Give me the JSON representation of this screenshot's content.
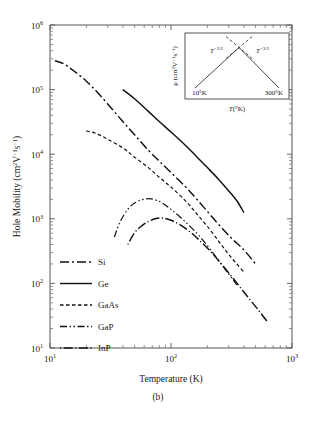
{
  "figure": {
    "caption": "(b)",
    "background": "#ffffff",
    "line_color": "#111111"
  },
  "axes": {
    "x": {
      "label": "Temperature (K)",
      "ticks": [
        {
          "value": 10,
          "mantissa": "10",
          "exponent": "1"
        },
        {
          "value": 100,
          "mantissa": "10",
          "exponent": "2"
        },
        {
          "value": 1000,
          "mantissa": "10",
          "exponent": "3"
        }
      ],
      "min": 10,
      "max": 1000,
      "scale": "log"
    },
    "y": {
      "label_prefix": "Hole Mobility (cm",
      "label_full": "Hole Mobility (cm²V⁻¹s⁻¹)",
      "ticks": [
        {
          "value": 10,
          "mantissa": "10",
          "exponent": "1"
        },
        {
          "value": 100,
          "mantissa": "10",
          "exponent": "2"
        },
        {
          "value": 1000,
          "mantissa": "10",
          "exponent": "3"
        },
        {
          "value": 10000,
          "mantissa": "10",
          "exponent": "4"
        },
        {
          "value": 100000,
          "mantissa": "10",
          "exponent": "5"
        },
        {
          "value": 1000000,
          "mantissa": "10",
          "exponent": "6"
        }
      ],
      "min": 10,
      "max": 1000000,
      "scale": "log"
    }
  },
  "legend": {
    "items": [
      {
        "label": "Si",
        "dash": "9 3 2 3"
      },
      {
        "label": "Ge",
        "dash": "none"
      },
      {
        "label": "GaAs",
        "dash": "3.5 2.5"
      },
      {
        "label": "GaP",
        "dash": "7 2.5 1.5 2.5 1.5 2.5"
      },
      {
        "label": "InP",
        "dash": "1.2 2.5 9 2.5"
      }
    ]
  },
  "inset": {
    "y_label": "μ (cm² V⁻¹ s⁻¹)",
    "x_label": "T(°K)",
    "left_branch_label": "T",
    "left_branch_exponent": "−3/2",
    "right_branch_label": "T",
    "right_branch_exponent": "−3/2",
    "left_tick_label": "10°K",
    "right_tick_label": "300°K"
  },
  "chart_data": {
    "type": "line",
    "title": "",
    "xlabel": "Temperature (K)",
    "ylabel": "Hole Mobility (cm2 V-1 s-1)",
    "xscale": "log",
    "yscale": "log",
    "xlim": [
      10,
      1000
    ],
    "ylim": [
      10,
      1000000
    ],
    "grid": false,
    "legend_position": "lower-left",
    "series": [
      {
        "name": "Si",
        "dash": "9 3 2 3",
        "points": [
          [
            11,
            280000
          ],
          [
            13,
            250000
          ],
          [
            16,
            190000
          ],
          [
            20,
            135000
          ],
          [
            25,
            88000
          ],
          [
            32,
            52000
          ],
          [
            40,
            32000
          ],
          [
            50,
            20000
          ],
          [
            65,
            11500
          ],
          [
            80,
            7800
          ],
          [
            100,
            5200
          ],
          [
            130,
            3200
          ],
          [
            160,
            2100
          ],
          [
            200,
            1300
          ],
          [
            250,
            800
          ],
          [
            320,
            490
          ],
          [
            400,
            330
          ],
          [
            500,
            200
          ]
        ]
      },
      {
        "name": "Ge",
        "dash": "none",
        "points": [
          [
            40,
            100000
          ],
          [
            50,
            72000
          ],
          [
            65,
            46000
          ],
          [
            80,
            32000
          ],
          [
            100,
            22000
          ],
          [
            130,
            14000
          ],
          [
            160,
            9500
          ],
          [
            200,
            6200
          ],
          [
            250,
            4000
          ],
          [
            300,
            2700
          ],
          [
            350,
            1900
          ],
          [
            400,
            1250
          ]
        ]
      },
      {
        "name": "GaAs",
        "dash": "3.5 2.5",
        "points": [
          [
            20,
            23000
          ],
          [
            24,
            21000
          ],
          [
            30,
            17000
          ],
          [
            40,
            12500
          ],
          [
            50,
            9000
          ],
          [
            65,
            6200
          ],
          [
            80,
            4400
          ],
          [
            100,
            3100
          ],
          [
            130,
            1950
          ],
          [
            160,
            1250
          ],
          [
            200,
            760
          ],
          [
            250,
            440
          ],
          [
            300,
            280
          ],
          [
            350,
            200
          ],
          [
            400,
            150
          ]
        ]
      },
      {
        "name": "GaP",
        "dash": "7 2.5 1.5 2.5 1.5 2.5",
        "points": [
          [
            34,
            520
          ],
          [
            38,
            900
          ],
          [
            44,
            1400
          ],
          [
            50,
            1750
          ],
          [
            58,
            1980
          ],
          [
            66,
            2050
          ],
          [
            75,
            1950
          ],
          [
            85,
            1750
          ],
          [
            100,
            1400
          ],
          [
            120,
            1050
          ],
          [
            145,
            750
          ],
          [
            175,
            520
          ],
          [
            210,
            340
          ],
          [
            250,
            220
          ],
          [
            300,
            140
          ],
          [
            350,
            95
          ]
        ]
      },
      {
        "name": "InP",
        "dash": "1.2 2.5 9 2.5",
        "points": [
          [
            44,
            400
          ],
          [
            50,
            610
          ],
          [
            58,
            790
          ],
          [
            66,
            920
          ],
          [
            75,
            1010
          ],
          [
            85,
            1030
          ],
          [
            100,
            950
          ],
          [
            120,
            800
          ],
          [
            145,
            620
          ],
          [
            175,
            450
          ],
          [
            210,
            320
          ],
          [
            250,
            220
          ],
          [
            300,
            145
          ],
          [
            360,
            95
          ],
          [
            430,
            62
          ],
          [
            520,
            40
          ],
          [
            620,
            26
          ]
        ]
      }
    ]
  }
}
